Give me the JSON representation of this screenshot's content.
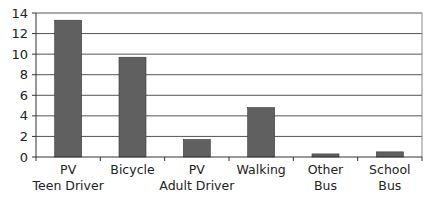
{
  "chart_data": {
    "type": "bar",
    "title": "",
    "xlabel": "",
    "ylabel": "",
    "categories": [
      [
        "PV",
        "Teen Driver"
      ],
      [
        "Bicycle"
      ],
      [
        "PV",
        "Adult Driver"
      ],
      [
        "Walking"
      ],
      [
        "Other",
        "Bus"
      ],
      [
        "School",
        "Bus"
      ]
    ],
    "category_names": [
      "PV Teen Driver",
      "Bicycle",
      "PV Adult Driver",
      "Walking",
      "Other Bus",
      "School Bus"
    ],
    "values": [
      13.3,
      9.7,
      1.7,
      4.8,
      0.3,
      0.5
    ],
    "ylim": [
      0,
      14
    ],
    "yticks": [
      0,
      2,
      4,
      6,
      8,
      10,
      12,
      14
    ],
    "grid": true,
    "legend": null,
    "colors": {
      "bar": "#606060",
      "bar_stroke": "#3a3a3a",
      "grid": "#555555",
      "axis": "#333333",
      "frame": "#888888"
    }
  }
}
